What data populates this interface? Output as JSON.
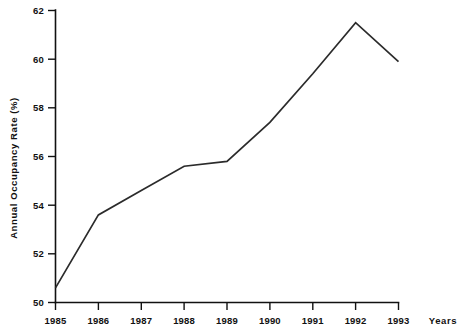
{
  "chart_data": {
    "type": "line",
    "title": "",
    "xlabel": "Years",
    "ylabel": "Annual Occupancy Rate (%)",
    "categories": [
      "1985",
      "1986",
      "1987",
      "1988",
      "1989",
      "1990",
      "1991",
      "1992",
      "1993"
    ],
    "x": [
      1985,
      1986,
      1987,
      1988,
      1989,
      1990,
      1991,
      1992,
      1993
    ],
    "values": [
      50.6,
      53.6,
      54.6,
      55.6,
      55.8,
      57.4,
      59.4,
      61.5,
      59.9
    ],
    "series": [
      {
        "name": "Annual Occupancy Rate",
        "values": [
          50.6,
          53.6,
          54.6,
          55.6,
          55.8,
          57.4,
          59.4,
          61.5,
          59.9
        ],
        "color": "#2b2b2b"
      }
    ],
    "ylim": [
      50,
      62
    ],
    "xlim": [
      1985,
      1993
    ],
    "yticks": [
      50,
      52,
      54,
      56,
      58,
      60,
      62
    ],
    "ytick_labels": [
      "50",
      "52",
      "54",
      "56",
      "58",
      "60",
      "62"
    ],
    "xticks": [
      1985,
      1986,
      1987,
      1988,
      1989,
      1990,
      1991,
      1992,
      1993
    ],
    "xtick_labels": [
      "1985",
      "1986",
      "1987",
      "1988",
      "1989",
      "1990",
      "1991",
      "1992",
      "1993"
    ],
    "grid": false,
    "legend": "none",
    "markers": false,
    "background_color": "#ffffff",
    "axis_color": "#111111"
  },
  "labels": {
    "y_axis_title": "Annual Occupancy Rate (%)",
    "x_axis_title": "Years"
  }
}
